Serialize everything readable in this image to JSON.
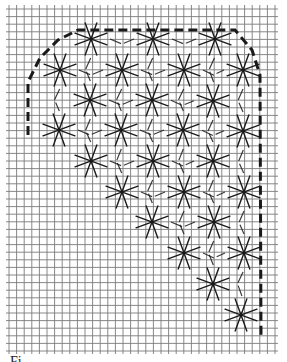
{
  "figure": {
    "type": "embroidery-chart",
    "caption": "Fi",
    "colors": {
      "background": "#ffffff",
      "grid": "#7a7a7a",
      "ink": "#1a1a1a"
    }
  },
  "grid": {
    "origin_x": 9,
    "origin_y": 9,
    "spacing": 7.6,
    "columns": 35,
    "rows": 45
  },
  "outline": {
    "style": "dashed",
    "points": [
      [
        28,
        135
      ],
      [
        28,
        82
      ],
      [
        40,
        58
      ],
      [
        58,
        40
      ],
      [
        78,
        30
      ],
      [
        235,
        30
      ],
      [
        252,
        50
      ],
      [
        260,
        75
      ],
      [
        261,
        338
      ]
    ]
  },
  "stars": {
    "arm_length": 17,
    "arm_angles_deg": [
      20,
      70,
      110,
      160,
      200,
      250,
      290,
      340
    ],
    "centers": [
      [
        91,
        39
      ],
      [
        153,
        39
      ],
      [
        215,
        39
      ],
      [
        60,
        70
      ],
      [
        122,
        70
      ],
      [
        184,
        70
      ],
      [
        243,
        70
      ],
      [
        90,
        100
      ],
      [
        152,
        100
      ],
      [
        213,
        101
      ],
      [
        59,
        130
      ],
      [
        121,
        130
      ],
      [
        183,
        130
      ],
      [
        243,
        131
      ],
      [
        91,
        161
      ],
      [
        153,
        161
      ],
      [
        213,
        161
      ],
      [
        122,
        192
      ],
      [
        184,
        192
      ],
      [
        244,
        192
      ],
      [
        152,
        222
      ],
      [
        214,
        222
      ],
      [
        184,
        253
      ],
      [
        244,
        253
      ],
      [
        213,
        284
      ],
      [
        241,
        315
      ]
    ]
  }
}
